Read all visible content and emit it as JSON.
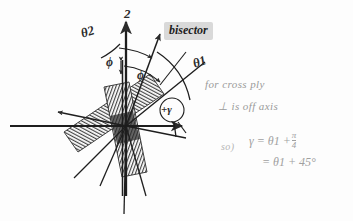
{
  "page": {
    "background_color": "#fdfdfd",
    "ink_color": "#2b2b2b",
    "pencil_color": "#9a9a9a",
    "highlight_color": "#d9d9d9"
  },
  "diagram": {
    "kind": "hand-drawn engineering sketch",
    "axes": {
      "vertical_label": "2",
      "horizontal_label": "1"
    },
    "labels": {
      "theta2": "θ2",
      "theta1": "θ1",
      "phi_upper": "ϕ",
      "phi_lower": "ϕ",
      "gamma_circled": "+γ",
      "bisector": "bisector"
    },
    "plies": {
      "count": 2,
      "description": "two cross-hatched fiber plies crossing at the origin"
    }
  },
  "notes": {
    "line1": "for cross ply",
    "line2": "⊥ is off axis",
    "so": "so)"
  },
  "equations": {
    "line1_lhs": "γ =",
    "line1_rhs": "θ1 +",
    "fraction_num": "π",
    "fraction_den": "4",
    "line2": "= θ1 + 45°"
  }
}
